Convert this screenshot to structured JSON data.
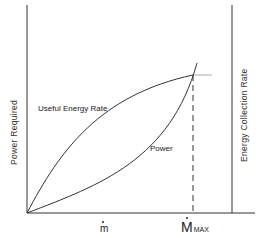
{
  "diagram": {
    "y_axis_label": "Power Required",
    "right_axis_label": "Energy Collection Rate",
    "curves": [
      {
        "name": "useful-energy-rate",
        "label": "Useful Energy Rate",
        "shape": "concave"
      },
      {
        "name": "power",
        "label": "Power",
        "shape": "convex"
      }
    ],
    "x_tick_mdot": "m",
    "x_tick_mmax_main": "M",
    "x_tick_mmax_sub": "MAX",
    "line_color": "#222222"
  }
}
